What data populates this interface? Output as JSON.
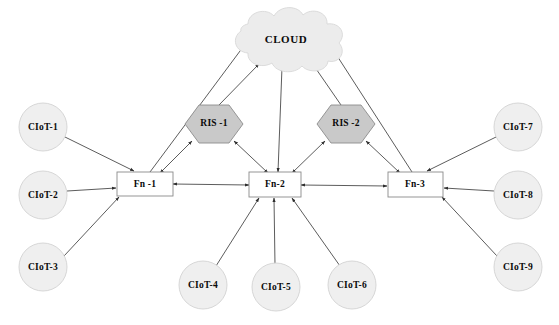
{
  "diagram": {
    "colors": {
      "cloud_fill": "#ececec",
      "circle_fill": "#efefef",
      "ris_fill": "#c9c9c9",
      "box_fill": "#ffffff",
      "edge_stroke": "#4a4a4a",
      "text": "#0a0a0a"
    },
    "cloud": {
      "label": "CLOUD",
      "shape": "cloud",
      "cx": 286,
      "cy": 40
    },
    "ris_nodes": [
      {
        "id": "ris1",
        "label": "RIS -1",
        "shape": "hexagon",
        "cx": 214,
        "cy": 124
      },
      {
        "id": "ris2",
        "label": "RIS -2",
        "shape": "hexagon",
        "cx": 346,
        "cy": 124
      }
    ],
    "fog_nodes": [
      {
        "id": "fn1",
        "label": "Fn -1",
        "shape": "rectangle",
        "cx": 145,
        "cy": 184
      },
      {
        "id": "fn2",
        "label": "Fn-2",
        "shape": "rectangle",
        "cx": 275,
        "cy": 184
      },
      {
        "id": "fn3",
        "label": "Fn-3",
        "shape": "rectangle",
        "cx": 415,
        "cy": 184
      }
    ],
    "ciot_nodes": [
      {
        "id": "ciot1",
        "label": "CIoT-1",
        "shape": "circle",
        "cx": 43,
        "cy": 127
      },
      {
        "id": "ciot2",
        "label": "CIoT-2",
        "shape": "circle",
        "cx": 43,
        "cy": 195
      },
      {
        "id": "ciot3",
        "label": "CIoT-3",
        "shape": "circle",
        "cx": 43,
        "cy": 267
      },
      {
        "id": "ciot4",
        "label": "CIoT-4",
        "shape": "circle",
        "cx": 203,
        "cy": 285
      },
      {
        "id": "ciot5",
        "label": "CIoT-5",
        "shape": "circle",
        "cx": 276,
        "cy": 287
      },
      {
        "id": "ciot6",
        "label": "CIoT-6",
        "shape": "circle",
        "cx": 352,
        "cy": 285
      },
      {
        "id": "ciot7",
        "label": "CIoT-7",
        "shape": "circle",
        "cx": 518,
        "cy": 127
      },
      {
        "id": "ciot8",
        "label": "CIoT-8",
        "shape": "circle",
        "cx": 518,
        "cy": 195
      },
      {
        "id": "ciot9",
        "label": "CIoT-9",
        "shape": "circle",
        "cx": 518,
        "cy": 267
      }
    ],
    "edges": [
      {
        "from": "fn1",
        "to": "cloud",
        "arrows": "single"
      },
      {
        "from": "ris1",
        "to": "cloud",
        "arrows": "single"
      },
      {
        "from": "fn2",
        "to": "cloud",
        "arrows": "double"
      },
      {
        "from": "ris2",
        "to": "cloud",
        "arrows": "single"
      },
      {
        "from": "fn3",
        "to": "cloud",
        "arrows": "single"
      },
      {
        "from": "fn1",
        "to": "ris1",
        "arrows": "double"
      },
      {
        "from": "fn2",
        "to": "ris1",
        "arrows": "double"
      },
      {
        "from": "fn2",
        "to": "ris2",
        "arrows": "double"
      },
      {
        "from": "fn3",
        "to": "ris2",
        "arrows": "double"
      },
      {
        "from": "fn1",
        "to": "fn2",
        "arrows": "double"
      },
      {
        "from": "fn2",
        "to": "fn3",
        "arrows": "double"
      },
      {
        "from": "ciot1",
        "to": "fn1",
        "arrows": "single"
      },
      {
        "from": "ciot2",
        "to": "fn1",
        "arrows": "single"
      },
      {
        "from": "ciot3",
        "to": "fn1",
        "arrows": "single"
      },
      {
        "from": "ciot4",
        "to": "fn2",
        "arrows": "single"
      },
      {
        "from": "ciot5",
        "to": "fn2",
        "arrows": "single"
      },
      {
        "from": "ciot6",
        "to": "fn2",
        "arrows": "single"
      },
      {
        "from": "ciot7",
        "to": "fn3",
        "arrows": "single"
      },
      {
        "from": "ciot8",
        "to": "fn3",
        "arrows": "single"
      },
      {
        "from": "ciot9",
        "to": "fn3",
        "arrows": "single"
      }
    ]
  }
}
